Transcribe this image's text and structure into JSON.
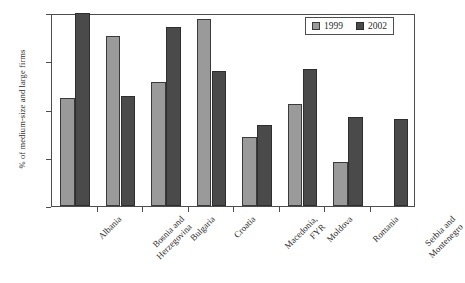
{
  "chart_data": {
    "type": "bar",
    "title": "",
    "xlabel": "",
    "ylabel": "% of medium-size and large firms",
    "ylim": [
      0,
      100
    ],
    "yticks": [
      0,
      25,
      50,
      75,
      100
    ],
    "ytick_labels": [
      "0",
      "25",
      "50",
      "75",
      "100"
    ],
    "grid": false,
    "legend_position": "top-right",
    "categories": [
      "Albania",
      "Bosnia and Herzegovina",
      "Bulgaria",
      "Croatia",
      "Macedonia, FYR",
      "Moldova",
      "Romania",
      "Serbia and Montenegro"
    ],
    "category_lines": [
      [
        "Albania"
      ],
      [
        "Bosnia and",
        "Herzegovina"
      ],
      [
        "Bulgaria"
      ],
      [
        "Croatia"
      ],
      [
        "Macedonia,",
        "FYR"
      ],
      [
        "Moldova"
      ],
      [
        "Romania"
      ],
      [
        "Serbia and",
        "Montenegro"
      ]
    ],
    "series": [
      {
        "name": "1999",
        "color": "#9a9a9a",
        "values": [
          56,
          88,
          64,
          97,
          36,
          53,
          23,
          null
        ]
      },
      {
        "name": "2002",
        "color": "#4a4a4a",
        "values": [
          100,
          57,
          93,
          70,
          42,
          71,
          46,
          45
        ]
      }
    ]
  },
  "legend": {
    "entries": [
      {
        "label": "1999"
      },
      {
        "label": "2002"
      }
    ]
  }
}
